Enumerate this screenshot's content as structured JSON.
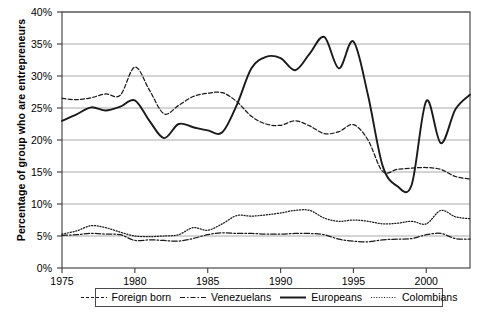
{
  "chart_data": {
    "type": "line",
    "title": "",
    "xlabel": "",
    "ylabel": "Percentage of group who are entrepreneurs",
    "xlim": [
      1975,
      2003
    ],
    "ylim": [
      0,
      40
    ],
    "ytick_labels": [
      "40%",
      "35%",
      "30%",
      "25%",
      "20%",
      "15%",
      "10%",
      "5%",
      "0%"
    ],
    "ytick_values": [
      40,
      35,
      30,
      25,
      20,
      15,
      10,
      5,
      0
    ],
    "xtick_labels": [
      "1975",
      "1980",
      "1985",
      "1990",
      "1995",
      "2000"
    ],
    "xtick_values": [
      1975,
      1980,
      1985,
      1990,
      1995,
      2000
    ],
    "grid": "horizontal",
    "legend_position": "below-axes",
    "x": [
      1975,
      1976,
      1977,
      1978,
      1979,
      1980,
      1981,
      1982,
      1983,
      1984,
      1985,
      1986,
      1987,
      1988,
      1989,
      1990,
      1991,
      1992,
      1993,
      1994,
      1995,
      1996,
      1997,
      1998,
      1999,
      2000,
      2001,
      2002,
      2003
    ],
    "series": [
      {
        "name": "Foreign born",
        "style": "dashed",
        "color": "#1a1a1a",
        "values": [
          26.5,
          26.3,
          26.6,
          27.2,
          27.0,
          31.4,
          27.8,
          24.1,
          25.4,
          26.8,
          27.3,
          27.4,
          26.0,
          23.7,
          22.5,
          22.3,
          23.0,
          22.2,
          21.0,
          21.3,
          22.4,
          20.0,
          15.1,
          15.4,
          15.6,
          15.7,
          15.4,
          14.3,
          13.9
        ]
      },
      {
        "name": "Venezuelans",
        "style": "dash-dot",
        "color": "#1a1a1a",
        "values": [
          5.1,
          5.2,
          5.4,
          5.3,
          5.2,
          4.3,
          4.4,
          4.3,
          4.2,
          4.6,
          5.2,
          5.5,
          5.4,
          5.4,
          5.3,
          5.3,
          5.4,
          5.4,
          5.2,
          4.5,
          4.2,
          4.1,
          4.4,
          4.5,
          4.6,
          5.2,
          5.4,
          4.6,
          4.5
        ]
      },
      {
        "name": "Europeans",
        "style": "solid",
        "color": "#1a1a1a",
        "values": [
          23.0,
          24.0,
          25.1,
          24.6,
          25.2,
          26.2,
          23.0,
          20.3,
          22.5,
          22.0,
          21.5,
          21.2,
          25.5,
          31.2,
          33.0,
          32.8,
          30.9,
          33.5,
          36.1,
          31.2,
          35.4,
          27.0,
          16.0,
          12.8,
          13.0,
          26.1,
          19.5,
          24.8,
          27.1
        ]
      },
      {
        "name": "Colombians",
        "style": "dotted",
        "color": "#1a1a1a",
        "values": [
          5.3,
          5.8,
          6.6,
          6.3,
          5.6,
          5.0,
          4.9,
          5.0,
          5.2,
          6.3,
          5.9,
          6.9,
          8.2,
          8.1,
          8.3,
          8.6,
          9.0,
          9.0,
          7.8,
          7.3,
          7.5,
          7.3,
          6.9,
          7.0,
          7.3,
          6.9,
          9.0,
          8.0,
          7.7
        ]
      }
    ]
  },
  "legend": {
    "entries": [
      {
        "label": "Foreign born",
        "style": "dashed"
      },
      {
        "label": "Venezuelans",
        "style": "dash-dot"
      },
      {
        "label": "Europeans",
        "style": "solid"
      },
      {
        "label": "Colombians",
        "style": "dotted"
      }
    ]
  },
  "axes": {
    "frame_color": "#4a4a4a",
    "grid_color": "#a8a8a8",
    "line_color": "#1a1a1a"
  }
}
